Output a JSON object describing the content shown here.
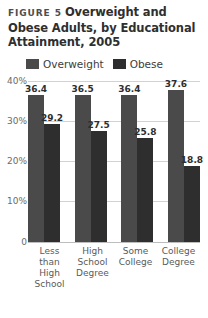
{
  "figure": {
    "label": "FIGURE 5",
    "title_lines": [
      "Overweight and",
      "Obese Adults, by Educational",
      "Attainment, 2005"
    ],
    "title_full": "Overweight and Obese Adults, by Educational Attainment, 2005"
  },
  "legend": {
    "items": [
      {
        "label": "Overweight",
        "color": "#4a4a4a"
      },
      {
        "label": "Obese",
        "color": "#2e2e2e"
      }
    ]
  },
  "axis": {
    "y_ticks": [
      "0",
      "10%",
      "20%",
      "30%",
      "40%"
    ],
    "y_tick_values": [
      0,
      10,
      20,
      30,
      40
    ],
    "y_minor_values": [
      5,
      15,
      25,
      35
    ]
  },
  "chart_data": {
    "type": "bar",
    "xlabel": "",
    "ylabel": "",
    "ylim": [
      0,
      40
    ],
    "ytick_labels": [
      "0",
      "10%",
      "20%",
      "30%",
      "40%"
    ],
    "ytick_values": [
      0,
      10,
      20,
      30,
      40
    ],
    "grid": true,
    "legend_position": "top-left",
    "categories": [
      "Less than High School",
      "High School Degree",
      "Some College",
      "College Degree"
    ],
    "category_lines": [
      [
        "Less than",
        "High",
        "School"
      ],
      [
        "High",
        "School",
        "Degree"
      ],
      [
        "Some",
        "College"
      ],
      [
        "College",
        "Degree"
      ]
    ],
    "series": [
      {
        "name": "Overweight",
        "color": "#4a4a4a",
        "values": [
          36.4,
          36.5,
          36.4,
          37.6
        ],
        "labels": [
          "36.4",
          "36.5",
          "36.4",
          "37.6"
        ]
      },
      {
        "name": "Obese",
        "color": "#2e2e2e",
        "values": [
          29.2,
          27.5,
          25.8,
          18.8
        ],
        "labels": [
          "29.2",
          "27.5",
          "25.8",
          "18.8"
        ]
      }
    ]
  }
}
